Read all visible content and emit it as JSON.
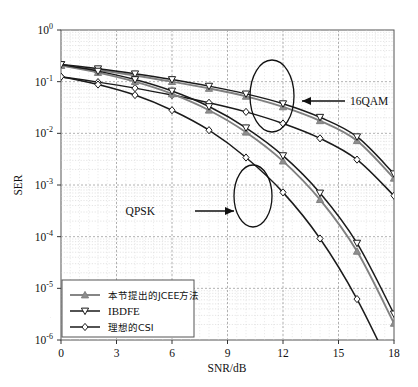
{
  "chart_data": {
    "type": "line",
    "title": "",
    "xlabel": "SNR/dB",
    "ylabel": "SER",
    "xlim": [
      0,
      18
    ],
    "ylim": [
      1e-06,
      1
    ],
    "yscale": "log",
    "xticks": [
      "0",
      "3",
      "6",
      "9",
      "12",
      "15",
      "18"
    ],
    "xtick_values": [
      0,
      3,
      6,
      9,
      12,
      15,
      18
    ],
    "yticks": [
      "10^0",
      "10^-1",
      "10^-2",
      "10^-3",
      "10^-4",
      "10^-5",
      "10^-6"
    ],
    "ytick_bases": [
      "10",
      "10",
      "10",
      "10",
      "10",
      "10",
      "10"
    ],
    "ytick_exps": [
      "0",
      "-1",
      "-2",
      "-3",
      "-4",
      "-5",
      "-6"
    ],
    "ytick_values": [
      1,
      0.1,
      0.01,
      0.001,
      0.0001,
      1e-05,
      1e-06
    ],
    "grid": true,
    "grid_minor": true,
    "legend_position": "lower left",
    "x": [
      0,
      2,
      4,
      6,
      8,
      10,
      12,
      14,
      16,
      18
    ],
    "series": [
      {
        "name": "本节提出的JCEE方法",
        "marker": "triangle-up",
        "color": "#808080",
        "group": "16QAM",
        "values": [
          0.205,
          0.168,
          0.132,
          0.1,
          0.074,
          0.052,
          0.0325,
          0.0175,
          0.0072,
          0.00135
        ]
      },
      {
        "name": "IBDFE",
        "marker": "triangle-down",
        "color": "#1a1a1a",
        "group": "16QAM",
        "values": [
          0.215,
          0.178,
          0.142,
          0.11,
          0.082,
          0.058,
          0.0375,
          0.0205,
          0.0086,
          0.00165
        ]
      },
      {
        "name": "理想的CSI",
        "marker": "diamond",
        "color": "#1a1a1a",
        "group": "16QAM",
        "values": [
          0.125,
          0.098,
          0.075,
          0.055,
          0.039,
          0.026,
          0.0155,
          0.008,
          0.0031,
          0.00062
        ]
      },
      {
        "name": "本节提出的JCEE方法",
        "marker": "triangle-up",
        "color": "#808080",
        "group": "QPSK",
        "values": [
          0.205,
          0.15,
          0.1,
          0.058,
          0.028,
          0.0105,
          0.0029,
          0.00052,
          5.2e-05,
          2.1e-06
        ]
      },
      {
        "name": "IBDFE",
        "marker": "triangle-down",
        "color": "#1a1a1a",
        "group": "QPSK",
        "values": [
          0.215,
          0.16,
          0.11,
          0.066,
          0.033,
          0.0128,
          0.0037,
          0.0007,
          7.5e-05,
          3.2e-06
        ]
      },
      {
        "name": "理想的CSI",
        "marker": "diamond",
        "color": "#1a1a1a",
        "group": "QPSK",
        "values": [
          0.125,
          0.088,
          0.055,
          0.028,
          0.0115,
          0.0034,
          0.00072,
          9.2e-05,
          6.2e-06,
          2.2e-07
        ]
      }
    ],
    "annotations": [
      {
        "text": "16QAM",
        "type": "arrow-label",
        "points_to": "16QAM curve cluster"
      },
      {
        "text": "QPSK",
        "type": "arrow-label",
        "points_to": "QPSK curve cluster"
      }
    ],
    "ellipses": [
      {
        "label": "16QAM highlight"
      },
      {
        "label": "QPSK highlight"
      }
    ]
  },
  "legend": {
    "entries": [
      {
        "label": "本节提出的JCEE方法",
        "marker": "triangle-up"
      },
      {
        "label": "IBDFE",
        "marker": "triangle-down"
      },
      {
        "label": "理想的CSI",
        "marker": "diamond"
      }
    ]
  },
  "colors": {
    "proposed": "#808080",
    "ibdfe": "#1a1a1a",
    "ideal": "#1a1a1a",
    "axis": "#4d4d4d",
    "grid": "#bdbdbd",
    "background": "#ffffff"
  }
}
